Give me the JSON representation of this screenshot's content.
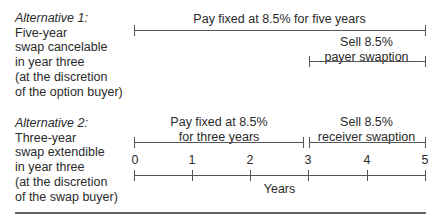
{
  "alternative1": {
    "title": "Alternative 1:",
    "lines": [
      "Five-year",
      "swap cancelable",
      "in year three",
      "(at the discretion",
      "of the option buyer)"
    ],
    "bar_top_label": "Pay fixed at 8.5% for five years",
    "bar_option_label": [
      "Sell 8.5%",
      "payer swaption"
    ]
  },
  "alternative2": {
    "title": "Alternative 2:",
    "lines": [
      "Three-year",
      "swap extendible",
      "in year three",
      "(at the discretion",
      "of the swap buyer)"
    ],
    "bar_swap_label": [
      "Pay fixed at 8.5%",
      "for three years"
    ],
    "bar_option_label": [
      "Sell 8.5%",
      "receiver swaption"
    ]
  },
  "axis": {
    "ticks": [
      "0",
      "1",
      "2",
      "3",
      "4",
      "5"
    ],
    "label": "Years"
  }
}
